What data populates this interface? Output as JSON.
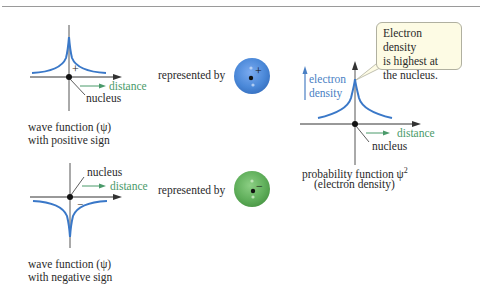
{
  "panels": {
    "positive_wave": {
      "sign_label": "+",
      "axis_label_distance": "distance",
      "axis_label_nucleus": "nucleus",
      "caption_line1": "wave function (ψ)",
      "caption_line2": "with positive sign",
      "represented_by": "represented by",
      "orbital_sign": "+",
      "orbital_color": "#4a88d8"
    },
    "negative_wave": {
      "sign_label": "−",
      "axis_label_distance": "distance",
      "axis_label_nucleus": "nucleus",
      "caption_line1": "wave function (ψ)",
      "caption_line2": "with negative sign",
      "represented_by": "represented by",
      "orbital_sign": "−",
      "orbital_color": "#5fae5a"
    },
    "probability": {
      "y_label_line1": "electron",
      "y_label_line2": "density",
      "axis_label_distance": "distance",
      "axis_label_nucleus": "nucleus",
      "caption_line1": "probability function ψ",
      "caption_superscript": "2",
      "caption_line2": "(electron density)",
      "callout_line1": "Electron density",
      "callout_line2": "is highest at",
      "callout_line3": "the nucleus."
    }
  },
  "colors": {
    "curve": "#3a78c8",
    "axis": "#3a3a3a",
    "distance_label": "#4a9a6a",
    "density_label": "#4a7fc4",
    "callout_fill": "#fdfbe4"
  }
}
